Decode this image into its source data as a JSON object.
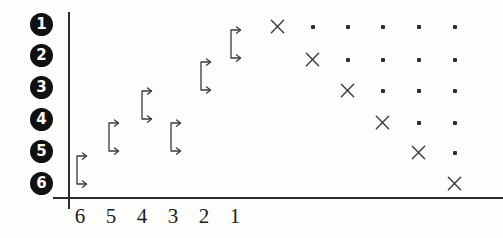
{
  "figure": {
    "title": "",
    "axis_color": "#2b2b2b",
    "marker_color": "#3b3b3b",
    "label_badge_color": "#111111"
  },
  "chart_data": {
    "type": "scatter",
    "title": "",
    "xlabel": "",
    "ylabel": "",
    "grid": false,
    "legend": null,
    "x_tick_labels": [
      "6",
      "5",
      "4",
      "3",
      "2",
      "1"
    ],
    "y_tick_labels": [
      "1",
      "2",
      "3",
      "4",
      "5",
      "6"
    ],
    "y_tick_style": "filled-circle-number",
    "x_axis_order": "descending",
    "series": [
      {
        "name": "bracket-arrows",
        "symbol": "bracket-double-arrow",
        "points": [
          {
            "x": 6,
            "y": 6,
            "px": 72,
            "py": 152,
            "label": "1"
          },
          {
            "x": 5,
            "y": 5,
            "px": 104,
            "py": 119,
            "label": "2"
          },
          {
            "x": 4,
            "y": 4,
            "px": 137,
            "py": 87,
            "label": "3"
          },
          {
            "x": 3,
            "y": 4,
            "px": 166,
            "py": 119,
            "label": "4"
          },
          {
            "x": 2,
            "y": 3,
            "px": 196,
            "py": 58,
            "label": "5"
          },
          {
            "x": 1,
            "y": 2,
            "px": 226,
            "py": 26,
            "label": "6"
          }
        ]
      },
      {
        "name": "cross-markers",
        "symbol": "x",
        "points": [
          {
            "col": 1,
            "row": 1,
            "px": 278,
            "py": 27
          },
          {
            "col": 2,
            "row": 2,
            "px": 313,
            "py": 60
          },
          {
            "col": 3,
            "row": 3,
            "px": 348,
            "py": 91
          },
          {
            "col": 4,
            "row": 4,
            "px": 383,
            "py": 123
          },
          {
            "col": 5,
            "row": 5,
            "px": 419,
            "py": 153
          },
          {
            "col": 6,
            "row": 6,
            "px": 455,
            "py": 184
          }
        ]
      },
      {
        "name": "dot-markers",
        "symbol": "dot",
        "points": [
          {
            "col": 2,
            "row": 1,
            "px": 313,
            "py": 27
          },
          {
            "col": 3,
            "row": 1,
            "px": 348,
            "py": 27
          },
          {
            "col": 4,
            "row": 1,
            "px": 383,
            "py": 27
          },
          {
            "col": 5,
            "row": 1,
            "px": 419,
            "py": 27
          },
          {
            "col": 6,
            "row": 1,
            "px": 455,
            "py": 27
          },
          {
            "col": 3,
            "row": 2,
            "px": 348,
            "py": 60
          },
          {
            "col": 4,
            "row": 2,
            "px": 383,
            "py": 60
          },
          {
            "col": 5,
            "row": 2,
            "px": 419,
            "py": 60
          },
          {
            "col": 6,
            "row": 2,
            "px": 455,
            "py": 60
          },
          {
            "col": 4,
            "row": 3,
            "px": 383,
            "py": 91
          },
          {
            "col": 5,
            "row": 3,
            "px": 419,
            "py": 91
          },
          {
            "col": 6,
            "row": 3,
            "px": 455,
            "py": 91
          },
          {
            "col": 5,
            "row": 4,
            "px": 419,
            "py": 123
          },
          {
            "col": 6,
            "row": 4,
            "px": 455,
            "py": 123
          },
          {
            "col": 6,
            "row": 5,
            "px": 455,
            "py": 153
          }
        ]
      }
    ]
  },
  "y_axis": {
    "ticks": [
      {
        "label": "1",
        "py": 13
      },
      {
        "label": "2",
        "py": 44
      },
      {
        "label": "3",
        "py": 76
      },
      {
        "label": "4",
        "py": 108
      },
      {
        "label": "5",
        "py": 140
      },
      {
        "label": "6",
        "py": 172
      }
    ]
  },
  "x_axis": {
    "ticks": [
      {
        "label": "6",
        "px": 80
      },
      {
        "label": "5",
        "px": 111
      },
      {
        "label": "4",
        "px": 142
      },
      {
        "label": "3",
        "px": 173
      },
      {
        "label": "2",
        "px": 204
      },
      {
        "label": "1",
        "px": 235
      }
    ]
  }
}
